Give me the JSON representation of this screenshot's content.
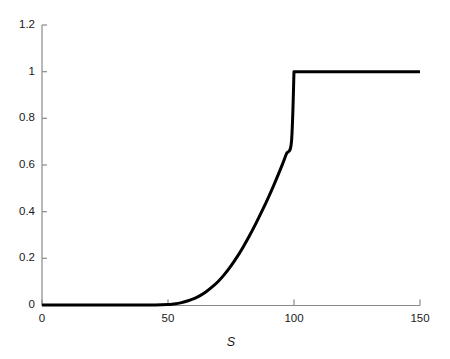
{
  "chart_data": {
    "type": "line",
    "title": "",
    "subtitle": "",
    "xlabel": "S",
    "ylabel": "",
    "xlim": [
      0,
      150
    ],
    "ylim": [
      0,
      1.2
    ],
    "grid": false,
    "legend": null,
    "xticks": [
      0,
      50,
      100,
      150
    ],
    "xticklabels": [
      "0",
      "50",
      "100",
      "150"
    ],
    "yticks": [
      0,
      0.2,
      0.4,
      0.6,
      0.8,
      1,
      1.2
    ],
    "yticklabels": [
      "0",
      "0.2",
      "0.4",
      "0.6",
      "0.8",
      "1",
      "1.2"
    ],
    "line_color": "#000000",
    "line_width": 3,
    "axis_color": "#8a8a8a",
    "series": [
      {
        "name": "payoff",
        "x": [
          0,
          5,
          10,
          15,
          20,
          25,
          30,
          35,
          40,
          45,
          50,
          52,
          55,
          58,
          60,
          62,
          65,
          68,
          70,
          72,
          75,
          78,
          80,
          82,
          85,
          88,
          90,
          92,
          95,
          97,
          99,
          100,
          105,
          110,
          115,
          120,
          125,
          130,
          135,
          140,
          145,
          150
        ],
        "y": [
          0,
          0,
          0,
          0,
          0,
          0,
          0,
          0,
          0,
          0,
          0.002,
          0.004,
          0.009,
          0.018,
          0.026,
          0.036,
          0.056,
          0.082,
          0.102,
          0.126,
          0.168,
          0.216,
          0.252,
          0.29,
          0.352,
          0.418,
          0.465,
          0.514,
          0.592,
          0.648,
          0.7,
          1.0,
          1.0,
          1.0,
          1.0,
          1.0,
          1.0,
          1.0,
          1.0,
          1.0,
          1.0,
          1.0
        ]
      }
    ],
    "annotations": []
  },
  "axes": {
    "x_axis_name": "x-axis",
    "y_axis_name": "y-axis"
  }
}
